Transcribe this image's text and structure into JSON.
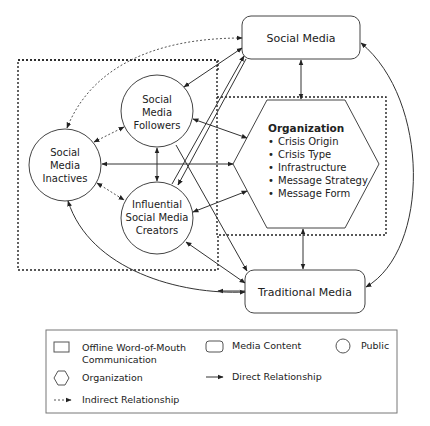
{
  "nodes": {
    "social_media": "Social Media",
    "traditional_media": "Traditional Media",
    "followers": [
      "Social",
      "Media",
      "Followers"
    ],
    "inactives": [
      "Social",
      "Media",
      "Inactives"
    ],
    "creators": [
      "Influential",
      "Social Media",
      "Creators"
    ],
    "organization": {
      "title": "Organization",
      "items": [
        "Crisis Origin",
        "Crisis Type",
        "Infrastructure",
        "Message Strategy",
        "Message Form"
      ]
    }
  },
  "legend": {
    "offline_wom": [
      "Offline Word-of-Mouth",
      "Communication"
    ],
    "media_content": "Media Content",
    "public": "Public",
    "organization": "Organization",
    "direct": "Direct Relationship",
    "indirect": "Indirect Relationship"
  },
  "bullet": "•"
}
